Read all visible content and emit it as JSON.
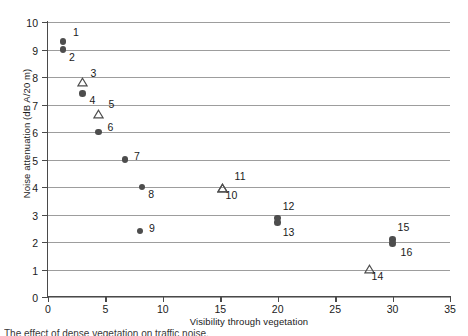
{
  "chart_data": {
    "type": "scatter",
    "title": "",
    "xlabel": "Visibility through vegetation",
    "ylabel": "Noise attenuation (dB A/20 m)",
    "xlim": [
      0,
      35
    ],
    "ylim": [
      0,
      10
    ],
    "xticks": [
      0,
      5,
      10,
      15,
      20,
      25,
      30,
      35
    ],
    "yticks": [
      0,
      1,
      2,
      3,
      4,
      5,
      6,
      7,
      8,
      9,
      10
    ],
    "grid": "horizontal",
    "legend": "none",
    "series": [
      {
        "name": "filled-circle",
        "marker": "circle-filled",
        "color": "#4d4d4d",
        "points": [
          {
            "label": "1",
            "x": 1.3,
            "y": 9.3,
            "label_dx": 10,
            "label_dy": -10
          },
          {
            "label": "2",
            "x": 1.3,
            "y": 9.0,
            "label_dx": 6,
            "label_dy": 6
          },
          {
            "label": "4",
            "x": 3.0,
            "y": 7.4,
            "label_dx": 7,
            "label_dy": 5
          },
          {
            "label": "6",
            "x": 4.4,
            "y": 6.0,
            "label_dx": 9,
            "label_dy": -6
          },
          {
            "label": "7",
            "x": 6.7,
            "y": 5.0,
            "label_dx": 9,
            "label_dy": -5
          },
          {
            "label": "8",
            "x": 8.2,
            "y": 4.0,
            "label_dx": 6,
            "label_dy": 6
          },
          {
            "label": "9",
            "x": 8.0,
            "y": 2.4,
            "label_dx": 9,
            "label_dy": -4
          },
          {
            "label": "12",
            "x": 20.0,
            "y": 2.88,
            "label_dx": 5,
            "label_dy": -13
          },
          {
            "label": "13",
            "x": 20.0,
            "y": 2.7,
            "label_dx": 5,
            "label_dy": 8
          },
          {
            "label": "15",
            "x": 30.0,
            "y": 2.1,
            "label_dx": 5,
            "label_dy": -13
          },
          {
            "label": "16",
            "x": 30.0,
            "y": 1.95,
            "label_dx": 8,
            "label_dy": 8
          }
        ]
      },
      {
        "name": "open-triangle",
        "marker": "triangle-open",
        "color": "#4d4d4d",
        "points": [
          {
            "label": "3",
            "x": 3.0,
            "y": 7.8,
            "label_dx": 8,
            "label_dy": -11
          },
          {
            "label": "5",
            "x": 4.4,
            "y": 6.65,
            "label_dx": 10,
            "label_dy": -11
          },
          {
            "label": "11",
            "x": 15.2,
            "y": 3.95,
            "label_dx": 12,
            "label_dy": -13
          },
          {
            "label": "10",
            "x": 15.2,
            "y": 3.95,
            "label_dx": 3,
            "label_dy": 6
          },
          {
            "label": "14",
            "x": 28.0,
            "y": 1.0,
            "label_dx": 2,
            "label_dy": 5
          }
        ]
      }
    ]
  },
  "axes": {
    "x_title": "Visibility through vegetation",
    "y_title": "Noise attenuation (dB A/20 m)",
    "x_tick_labels": [
      "0",
      "5",
      "10",
      "15",
      "20",
      "25",
      "30",
      "35"
    ],
    "y_tick_labels": [
      "0",
      "1",
      "2",
      "3",
      "4",
      "5",
      "6",
      "7",
      "8",
      "9",
      "10"
    ]
  },
  "colors": {
    "marker": "#4d4d4d",
    "gridline": "#9d9d9d",
    "axis": "#4a4a4a",
    "text": "#1a1a1a",
    "background": "#ffffff"
  },
  "caption": {
    "text": "The effect of dense vegetation on traffic noise."
  }
}
